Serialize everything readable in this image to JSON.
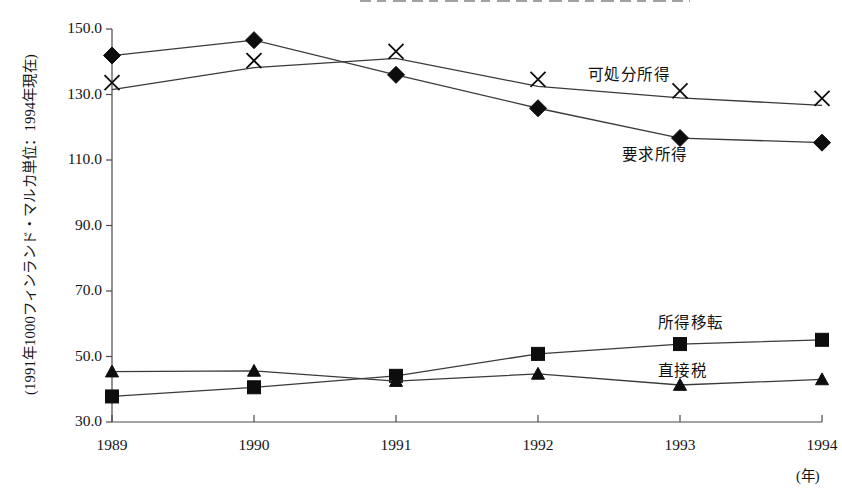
{
  "chart_data": {
    "type": "line",
    "title": "",
    "xlabel": "(年)",
    "ylabel": "(1991年1000フィンランド・マルカ単位：1994年現在)",
    "categories": [
      "1989",
      "1990",
      "1991",
      "1992",
      "1993",
      "1994"
    ],
    "x": [
      1989,
      1990,
      1991,
      1992,
      1993,
      1994
    ],
    "xlim": [
      1989,
      1994
    ],
    "ylim": [
      30.0,
      150.0
    ],
    "yticks": [
      "150.0",
      "130.0",
      "110.0",
      "90.0",
      "70.0",
      "50.0",
      "30.0"
    ],
    "ytick_values": [
      150.0,
      130.0,
      110.0,
      90.0,
      70.0,
      50.0,
      30.0
    ],
    "grid": false,
    "legend_position": "inline-annotations",
    "series": [
      {
        "name": "可処分所得",
        "marker": "x",
        "values": [
          131.5,
          138.2,
          141.0,
          132.5,
          129.0,
          126.7
        ],
        "label_x": 588,
        "label_y": 62
      },
      {
        "name": "要求所得",
        "marker": "diamond",
        "values": [
          141.9,
          146.6,
          136.0,
          125.8,
          116.7,
          115.3
        ],
        "label_x": 622,
        "label_y": 142
      },
      {
        "name": "所得移転",
        "marker": "square",
        "values": [
          37.8,
          40.6,
          44.1,
          50.8,
          53.8,
          55.1
        ],
        "label_x": 658,
        "label_y": 310
      },
      {
        "name": "直接税",
        "marker": "triangle",
        "values": [
          45.4,
          45.6,
          42.5,
          44.7,
          41.3,
          43.0
        ],
        "label_x": 658,
        "label_y": 358
      }
    ],
    "colors": {
      "line": "#3a3a3a",
      "marker": "#0d0d0d",
      "axis": "#4a4a4a",
      "text": "#141414",
      "background": "#ffffff"
    }
  }
}
